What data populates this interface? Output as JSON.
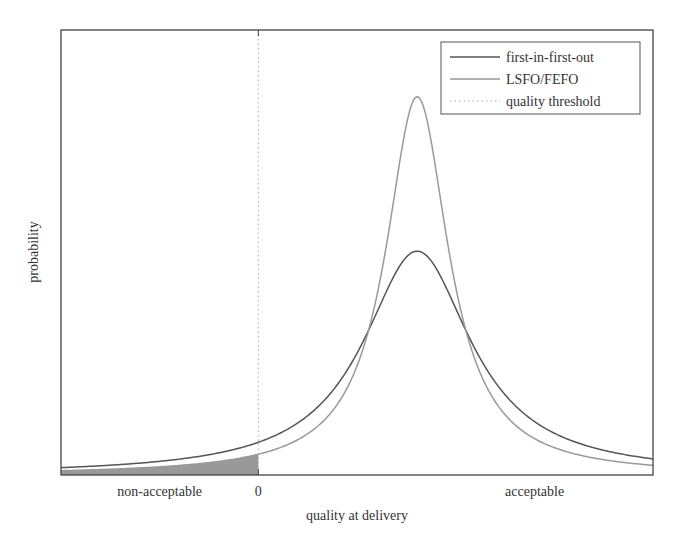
{
  "chart_data": {
    "type": "line",
    "title": "",
    "xlabel": "quality at delivery",
    "ylabel": "probability",
    "xlim": [
      -2.0,
      4.0
    ],
    "ylim": [
      0,
      1
    ],
    "x_tick_labels": [
      {
        "x": 0,
        "label": "0"
      }
    ],
    "region_labels": [
      {
        "label": "non-acceptable",
        "x": -1.0
      },
      {
        "label": "acceptable",
        "x": 2.8
      }
    ],
    "grid": false,
    "legend": {
      "position": "top-right",
      "entries": [
        "first-in-first-out",
        "LSFO/FEFO",
        "quality threshold"
      ]
    },
    "series": [
      {
        "name": "first-in-first-out",
        "kind": "cauchy",
        "center": 1.61,
        "scale": 0.666,
        "peak": 0.503,
        "color": "#555555"
      },
      {
        "name": "LSFO/FEFO",
        "kind": "cauchy",
        "center": 1.61,
        "scale": 0.388,
        "peak": 0.85,
        "color": "#999999"
      }
    ],
    "threshold": {
      "name": "quality threshold",
      "x": 0,
      "color": "#aaaaaa"
    },
    "shaded_region": {
      "series": "LSFO/FEFO",
      "from": -2.0,
      "to": 0,
      "color": "#999999",
      "meaning": "non-acceptable deliveries"
    }
  }
}
